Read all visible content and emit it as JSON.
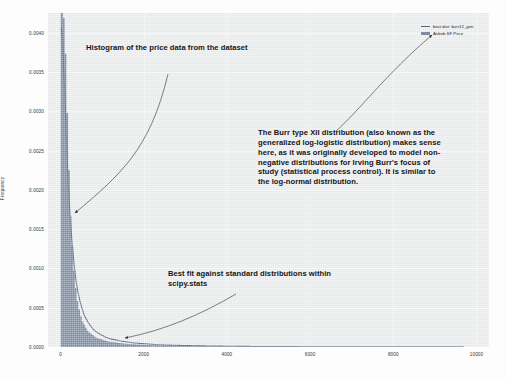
{
  "chart_data": {
    "type": "histogram",
    "title": "",
    "xlabel": "",
    "ylabel": "Frequency",
    "xlim": [
      -300,
      10600
    ],
    "ylim": [
      0,
      0.00425
    ],
    "xticks": [
      "0",
      "2000",
      "4000",
      "6000",
      "8000",
      "10000"
    ],
    "xtick_values": [
      0,
      2000,
      4000,
      6000,
      8000,
      10000
    ],
    "yticks": [
      "0.0000",
      "0.0005",
      "0.0010",
      "0.0015",
      "0.0020",
      "0.0025",
      "0.0030",
      "0.0035",
      "0.0040"
    ],
    "ytick_values": [
      0.0,
      0.0005,
      0.001,
      0.0015,
      0.002,
      0.0025,
      0.003,
      0.0035,
      0.004
    ],
    "grid": true,
    "legend_position": "upper right",
    "series": [
      {
        "name": "best dist: burr12_gen",
        "type": "line",
        "color": "#5b6d86",
        "x": [
          20,
          60,
          110,
          160,
          220,
          300,
          420,
          600,
          850,
          1200,
          1700,
          2400,
          3300,
          4500,
          6000,
          8000,
          10000
        ],
        "y": [
          0.0041,
          0.0039,
          0.0033,
          0.0026,
          0.0019,
          0.0013,
          0.00075,
          0.0004,
          0.00021,
          0.00011,
          6e-05,
          3e-05,
          1.6e-05,
          8e-06,
          4e-06,
          2e-06,
          1e-06
        ]
      },
      {
        "name": "Airbnb SF Price",
        "type": "bar",
        "color": "#7e8ea3",
        "x": [
          25,
          75,
          125,
          175,
          225,
          275,
          325,
          400,
          500,
          650,
          850,
          1150,
          1600,
          2200,
          3000,
          4200,
          5600,
          7200,
          9000,
          10200
        ],
        "y": [
          0.00425,
          0.00415,
          0.00325,
          0.00235,
          0.00165,
          0.0012,
          0.00085,
          0.00055,
          0.00034,
          0.0002,
          0.00012,
          7e-05,
          4e-05,
          2.2e-05,
          1.3e-05,
          7e-06,
          4e-06,
          2e-06,
          1e-06,
          5e-07
        ]
      }
    ]
  },
  "legend": {
    "items": [
      {
        "label": "best dist: burr12_gen",
        "color": "#5b6d86",
        "marker": "line"
      },
      {
        "label": "Airbnb SF Price",
        "color": "#7e8ea3",
        "marker": "bar"
      }
    ]
  },
  "annotations": [
    {
      "id": "histogram-note",
      "text": "Histogram of the price data from the dataset"
    },
    {
      "id": "burr-note",
      "text": "The Burr type XII distribution (also known as the generalized log-logistic distribution) makes sense here, as it was originally developed to model non-negative distributions for Irving Burr's focus of study (statistical process control). It is similar to the log-normal distribution."
    },
    {
      "id": "bestfit-note",
      "text": "Best fit against standard distributions within scipy.stats"
    }
  ],
  "colors": {
    "plot_background": "#eceef0",
    "page_background": "#fdfdfd",
    "grid": "#f7f8f9",
    "annotation_text": "#161616",
    "arrow": "#3a3a3a"
  }
}
